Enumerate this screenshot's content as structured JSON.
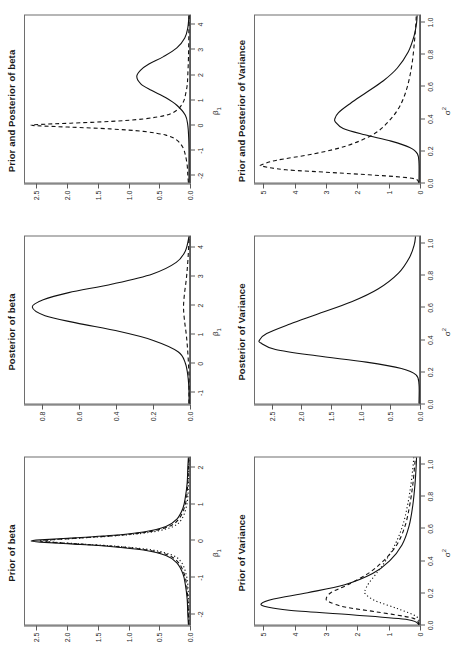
{
  "figure": {
    "layout": "2 rows x 3 columns of density plots",
    "rows": [
      {
        "row_name": "beta-row",
        "panels": [
          "prior-of-beta",
          "posterior-of-beta",
          "prior-and-posterior-of-beta"
        ]
      },
      {
        "row_name": "variance-row",
        "panels": [
          "prior-of-variance",
          "posterior-of-variance",
          "prior-and-posterior-of-variance"
        ]
      }
    ]
  },
  "panels": [
    {
      "id": "prior-of-beta",
      "title": "Prior of beta",
      "xlabel_base": "β",
      "xlabel_sub": "1",
      "xlabel_sup": "",
      "xticks": [
        "-2",
        "-1",
        "0",
        "1",
        "2"
      ],
      "yticks": [
        "0.0",
        "0.5",
        "1.0",
        "1.5",
        "2.0",
        "2.5"
      ]
    },
    {
      "id": "posterior-of-beta",
      "title": "Posterior of beta",
      "xlabel_base": "β",
      "xlabel_sub": "1",
      "xlabel_sup": "",
      "xticks": [
        "-1",
        "0",
        "1",
        "2",
        "3",
        "4"
      ],
      "yticks": [
        "0.0",
        "0.2",
        "0.4",
        "0.6",
        "0.8"
      ]
    },
    {
      "id": "prior-and-posterior-of-beta",
      "title": "Prior and Posterior of beta",
      "xlabel_base": "β",
      "xlabel_sub": "1",
      "xlabel_sup": "",
      "xticks": [
        "-2",
        "-1",
        "0",
        "1",
        "2",
        "3",
        "4"
      ],
      "yticks": [
        "0.0",
        "0.5",
        "1.0",
        "1.5",
        "2.0",
        "2.5"
      ]
    },
    {
      "id": "prior-of-variance",
      "title": "Prior of Variance",
      "xlabel_base": "σ",
      "xlabel_sub": "",
      "xlabel_sup": "2",
      "xticks": [
        "0.0",
        "0.2",
        "0.4",
        "0.6",
        "0.8",
        "1.0"
      ],
      "yticks": [
        "0",
        "1",
        "2",
        "3",
        "4",
        "5"
      ]
    },
    {
      "id": "posterior-of-variance",
      "title": "Posterior of Variance",
      "xlabel_base": "σ",
      "xlabel_sub": "",
      "xlabel_sup": "2",
      "xticks": [
        "0.0",
        "0.2",
        "0.4",
        "0.6",
        "0.8",
        "1.0"
      ],
      "yticks": [
        "0.0",
        "0.5",
        "1.0",
        "1.5",
        "2.0",
        "2.5"
      ]
    },
    {
      "id": "prior-and-posterior-of-variance",
      "title": "Prior and Posterior of Variance",
      "xlabel_base": "σ",
      "xlabel_sub": "",
      "xlabel_sup": "2",
      "xticks": [
        "0.0",
        "0.2",
        "0.4",
        "0.6",
        "0.8",
        "1.0"
      ],
      "yticks": [
        "0",
        "1",
        "2",
        "3",
        "4",
        "5"
      ]
    }
  ],
  "colors": {
    "line": "#111111",
    "axis": "#5a5a5a",
    "frame": "#6e6e6e",
    "text": "#2b2b2b",
    "title": "#1a1a1a",
    "background": "#ffffff"
  },
  "chart_data": [
    {
      "id": "prior-of-beta",
      "type": "line",
      "title": "Prior of beta",
      "xlabel": "β₁",
      "ylabel": "",
      "xlim": [
        -2.3,
        2.3
      ],
      "ylim": [
        0,
        2.7
      ],
      "grid": false,
      "legend": "none",
      "xticks": [
        -2,
        -1,
        0,
        1,
        2
      ],
      "yticks": [
        0.0,
        0.5,
        1.0,
        1.5,
        2.0,
        2.5
      ],
      "series": [
        {
          "name": "prior-solid",
          "style": "solid",
          "peak_x": 0.0,
          "peak_y": 2.6,
          "x": [
            -2.3,
            -2.0,
            -1.6,
            -1.2,
            -0.9,
            -0.6,
            -0.4,
            -0.25,
            -0.15,
            -0.08,
            -0.03,
            0.0,
            0.03,
            0.08,
            0.15,
            0.25,
            0.4,
            0.6,
            0.9,
            1.2,
            1.6,
            2.0,
            2.3
          ],
          "y": [
            0.01,
            0.02,
            0.03,
            0.06,
            0.1,
            0.2,
            0.38,
            0.75,
            1.3,
            1.95,
            2.45,
            2.6,
            2.45,
            1.95,
            1.3,
            0.75,
            0.38,
            0.2,
            0.1,
            0.06,
            0.03,
            0.02,
            0.01
          ]
        },
        {
          "name": "prior-dashed",
          "style": "dashed",
          "peak_x": 0.0,
          "peak_y": 2.45,
          "x": [
            -2.3,
            -2.0,
            -1.6,
            -1.2,
            -0.9,
            -0.6,
            -0.4,
            -0.25,
            -0.15,
            -0.08,
            -0.03,
            0.0,
            0.03,
            0.08,
            0.15,
            0.25,
            0.4,
            0.6,
            0.9,
            1.2,
            1.6,
            2.0,
            2.3
          ],
          "y": [
            0.005,
            0.01,
            0.02,
            0.04,
            0.08,
            0.17,
            0.33,
            0.68,
            1.22,
            1.85,
            2.3,
            2.45,
            2.3,
            1.85,
            1.22,
            0.68,
            0.33,
            0.17,
            0.08,
            0.04,
            0.02,
            0.01,
            0.005
          ]
        },
        {
          "name": "prior-dotted",
          "style": "dotted",
          "peak_x": 0.0,
          "peak_y": 2.4,
          "x": [
            -2.3,
            -2.0,
            -1.6,
            -1.2,
            -0.9,
            -0.6,
            -0.4,
            -0.25,
            -0.15,
            -0.08,
            -0.03,
            0.0,
            0.03,
            0.08,
            0.15,
            0.25,
            0.4,
            0.6,
            0.9,
            1.2,
            1.6,
            2.0,
            2.3
          ],
          "y": [
            0.002,
            0.004,
            0.008,
            0.02,
            0.05,
            0.12,
            0.26,
            0.6,
            1.15,
            1.8,
            2.25,
            2.4,
            2.25,
            1.8,
            1.15,
            0.6,
            0.26,
            0.12,
            0.05,
            0.02,
            0.008,
            0.004,
            0.002
          ]
        }
      ]
    },
    {
      "id": "posterior-of-beta",
      "type": "line",
      "title": "Posterior of beta",
      "xlabel": "β₁",
      "ylabel": "",
      "xlim": [
        -1.4,
        4.4
      ],
      "ylim": [
        0,
        0.9
      ],
      "grid": false,
      "legend": "none",
      "xticks": [
        -1,
        0,
        1,
        2,
        3,
        4
      ],
      "yticks": [
        0.0,
        0.2,
        0.4,
        0.6,
        0.8
      ],
      "series": [
        {
          "name": "posterior-solid",
          "style": "solid",
          "peak_x": 1.95,
          "peak_y": 0.86,
          "x": [
            -1.4,
            -1.0,
            -0.5,
            0.0,
            0.4,
            0.8,
            1.1,
            1.4,
            1.65,
            1.95,
            2.2,
            2.45,
            2.75,
            3.1,
            3.5,
            3.9,
            4.4
          ],
          "y": [
            0.0,
            0.0,
            0.005,
            0.02,
            0.06,
            0.2,
            0.38,
            0.62,
            0.79,
            0.86,
            0.8,
            0.66,
            0.42,
            0.2,
            0.07,
            0.02,
            0.0
          ]
        },
        {
          "name": "posterior-dashed",
          "style": "dashed",
          "peak_x": 1.95,
          "peak_y": 0.03,
          "x": [
            -1.4,
            -1.0,
            -0.5,
            0.0,
            0.5,
            1.0,
            1.5,
            1.95,
            2.4,
            2.9,
            3.4,
            3.9,
            4.4
          ],
          "y": [
            0.0,
            0.0,
            0.0,
            0.003,
            0.008,
            0.015,
            0.025,
            0.03,
            0.025,
            0.015,
            0.008,
            0.003,
            0.0
          ]
        }
      ]
    },
    {
      "id": "prior-and-posterior-of-beta",
      "type": "line",
      "title": "Prior and Posterior of beta",
      "xlabel": "β₁",
      "ylabel": "",
      "xlim": [
        -2.3,
        4.4
      ],
      "ylim": [
        0,
        2.7
      ],
      "grid": false,
      "legend": "none",
      "xticks": [
        -2,
        -1,
        0,
        1,
        2,
        3,
        4
      ],
      "yticks": [
        0.0,
        0.5,
        1.0,
        1.5,
        2.0,
        2.5
      ],
      "series": [
        {
          "name": "posterior-solid",
          "style": "solid",
          "peak_x": 1.95,
          "peak_y": 0.86,
          "x": [
            -2.3,
            -1.5,
            -1.0,
            -0.5,
            0.0,
            0.4,
            0.8,
            1.1,
            1.4,
            1.65,
            1.95,
            2.2,
            2.45,
            2.75,
            3.1,
            3.5,
            3.9,
            4.4
          ],
          "y": [
            0.0,
            0.0,
            0.0,
            0.005,
            0.02,
            0.06,
            0.2,
            0.38,
            0.62,
            0.79,
            0.86,
            0.8,
            0.66,
            0.42,
            0.2,
            0.07,
            0.02,
            0.0
          ]
        },
        {
          "name": "prior-dashed",
          "style": "dashed",
          "peak_x": 0.0,
          "peak_y": 2.6,
          "x": [
            -2.3,
            -2.0,
            -1.6,
            -1.2,
            -0.9,
            -0.6,
            -0.4,
            -0.25,
            -0.15,
            -0.08,
            -0.03,
            0.0,
            0.03,
            0.08,
            0.15,
            0.25,
            0.4,
            0.6,
            0.9,
            1.2,
            1.6,
            2.0,
            2.6,
            3.2,
            4.4
          ],
          "y": [
            0.01,
            0.02,
            0.03,
            0.06,
            0.1,
            0.2,
            0.38,
            0.75,
            1.3,
            1.95,
            2.45,
            2.6,
            2.45,
            1.95,
            1.3,
            0.75,
            0.38,
            0.2,
            0.1,
            0.06,
            0.03,
            0.02,
            0.01,
            0.005,
            0.0
          ]
        }
      ]
    },
    {
      "id": "prior-of-variance",
      "type": "line",
      "title": "Prior of Variance",
      "xlabel": "σ²",
      "ylabel": "",
      "xlim": [
        0,
        1.05
      ],
      "ylim": [
        0,
        5.3
      ],
      "grid": false,
      "legend": "none",
      "xticks": [
        0.0,
        0.2,
        0.4,
        0.6,
        0.8,
        1.0
      ],
      "yticks": [
        0,
        1,
        2,
        3,
        4,
        5
      ],
      "series": [
        {
          "name": "prior-solid",
          "style": "solid",
          "peak_x": 0.13,
          "peak_y": 5.1,
          "x": [
            0.0,
            0.03,
            0.06,
            0.09,
            0.11,
            0.13,
            0.16,
            0.2,
            0.25,
            0.32,
            0.4,
            0.5,
            0.62,
            0.75,
            0.88,
            1.0,
            1.05
          ],
          "y": [
            0.0,
            0.35,
            2.1,
            4.2,
            4.9,
            5.1,
            4.7,
            3.6,
            2.4,
            1.5,
            0.95,
            0.55,
            0.32,
            0.2,
            0.13,
            0.09,
            0.08
          ]
        },
        {
          "name": "prior-dashed",
          "style": "dashed",
          "peak_x": 0.16,
          "peak_y": 3.0,
          "x": [
            0.0,
            0.04,
            0.08,
            0.11,
            0.14,
            0.16,
            0.2,
            0.25,
            0.32,
            0.4,
            0.5,
            0.62,
            0.75,
            0.88,
            1.0,
            1.05
          ],
          "y": [
            0.0,
            0.2,
            1.4,
            2.4,
            2.88,
            3.0,
            2.85,
            2.3,
            1.65,
            1.15,
            0.72,
            0.45,
            0.3,
            0.2,
            0.14,
            0.12
          ]
        },
        {
          "name": "prior-dotted",
          "style": "dotted",
          "peak_x": 0.21,
          "peak_y": 1.75,
          "x": [
            0.0,
            0.05,
            0.1,
            0.15,
            0.19,
            0.21,
            0.26,
            0.32,
            0.4,
            0.5,
            0.62,
            0.75,
            0.88,
            1.0,
            1.05
          ],
          "y": [
            0.0,
            0.08,
            0.7,
            1.42,
            1.72,
            1.75,
            1.62,
            1.38,
            1.08,
            0.78,
            0.53,
            0.37,
            0.26,
            0.19,
            0.17
          ]
        }
      ]
    },
    {
      "id": "posterior-of-variance",
      "type": "line",
      "title": "Posterior of Variance",
      "xlabel": "σ²",
      "ylabel": "",
      "xlim": [
        0,
        1.05
      ],
      "ylim": [
        0,
        2.8
      ],
      "grid": false,
      "legend": "none",
      "xticks": [
        0.0,
        0.2,
        0.4,
        0.6,
        0.8,
        1.0
      ],
      "yticks": [
        0.0,
        0.5,
        1.0,
        1.5,
        2.0,
        2.5
      ],
      "series": [
        {
          "name": "posterior-solid",
          "style": "solid",
          "peak_x": 0.4,
          "peak_y": 2.72,
          "x": [
            0.0,
            0.12,
            0.18,
            0.22,
            0.26,
            0.3,
            0.34,
            0.38,
            0.4,
            0.44,
            0.5,
            0.56,
            0.64,
            0.72,
            0.82,
            0.92,
            1.0,
            1.05
          ],
          "y": [
            0.0,
            0.0,
            0.05,
            0.3,
            0.9,
            1.75,
            2.45,
            2.7,
            2.72,
            2.6,
            2.2,
            1.75,
            1.15,
            0.7,
            0.35,
            0.16,
            0.08,
            0.06
          ]
        }
      ]
    },
    {
      "id": "prior-and-posterior-of-variance",
      "type": "line",
      "title": "Prior and Posterior of Variance",
      "xlabel": "σ²",
      "ylabel": "",
      "xlim": [
        0,
        1.05
      ],
      "ylim": [
        0,
        5.3
      ],
      "grid": false,
      "legend": "none",
      "xticks": [
        0.0,
        0.2,
        0.4,
        0.6,
        0.8,
        1.0
      ],
      "yticks": [
        0,
        1,
        2,
        3,
        4,
        5
      ],
      "series": [
        {
          "name": "posterior-solid",
          "style": "solid",
          "peak_x": 0.4,
          "peak_y": 2.72,
          "x": [
            0.0,
            0.12,
            0.18,
            0.22,
            0.26,
            0.3,
            0.34,
            0.38,
            0.4,
            0.44,
            0.5,
            0.56,
            0.64,
            0.72,
            0.82,
            0.92,
            1.0,
            1.05
          ],
          "y": [
            0.0,
            0.0,
            0.05,
            0.3,
            0.9,
            1.75,
            2.45,
            2.7,
            2.72,
            2.6,
            2.2,
            1.75,
            1.15,
            0.7,
            0.35,
            0.16,
            0.08,
            0.06
          ]
        },
        {
          "name": "prior-dashed",
          "style": "dashed",
          "peak_x": 0.11,
          "peak_y": 5.1,
          "x": [
            0.0,
            0.03,
            0.06,
            0.08,
            0.1,
            0.11,
            0.14,
            0.18,
            0.23,
            0.3,
            0.38,
            0.48,
            0.6,
            0.74,
            0.88,
            1.0,
            1.05
          ],
          "y": [
            0.0,
            0.35,
            2.6,
            4.3,
            5.0,
            5.1,
            4.6,
            3.4,
            2.35,
            1.5,
            1.0,
            0.62,
            0.38,
            0.23,
            0.15,
            0.1,
            0.09
          ]
        }
      ]
    }
  ]
}
